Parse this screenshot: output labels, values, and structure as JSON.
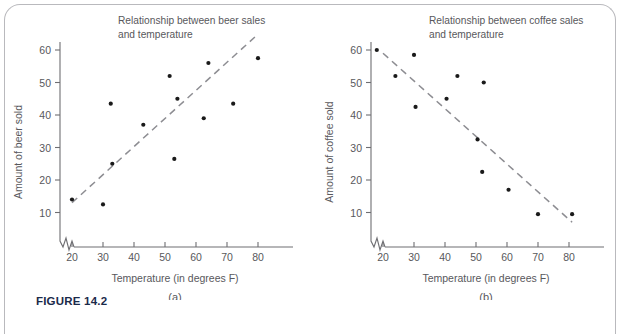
{
  "figure": {
    "caption": "FIGURE 14.2",
    "frame_color": "#b9b9bd",
    "text_color": "#58585c",
    "caption_color": "#1b2a4a",
    "point_color": "#1a1a1a",
    "trend_color": "#8d8d92"
  },
  "chart_data": [
    {
      "type": "scatter",
      "panel": "a",
      "panel_label": "(a)",
      "title": "Relationship between beer sales and temperature",
      "title_line1": "Relationship between beer sales",
      "title_line2": "and temperature",
      "xlabel": "Temperature (in degrees F)",
      "ylabel": "Amount of beer sold",
      "xlim": [
        15,
        90
      ],
      "ylim": [
        0,
        65
      ],
      "xticks": [
        20,
        30,
        40,
        50,
        60,
        70,
        80
      ],
      "yticks": [
        10,
        20,
        30,
        40,
        50,
        60
      ],
      "grid": false,
      "axis_break": true,
      "legend": "none",
      "relationship": "positive",
      "x": [
        20,
        30,
        32.5,
        33,
        43,
        51.5,
        53,
        54,
        62.5,
        64,
        72,
        80
      ],
      "y": [
        14,
        12.5,
        43.5,
        25,
        37,
        52,
        26.5,
        45,
        39,
        56,
        43.5,
        57.5
      ],
      "points": [
        {
          "x": 20,
          "y": 14
        },
        {
          "x": 30,
          "y": 12.5
        },
        {
          "x": 32.5,
          "y": 43.5
        },
        {
          "x": 33,
          "y": 25
        },
        {
          "x": 43,
          "y": 37
        },
        {
          "x": 51.5,
          "y": 52
        },
        {
          "x": 53,
          "y": 26.5
        },
        {
          "x": 54,
          "y": 45
        },
        {
          "x": 62.5,
          "y": 39
        },
        {
          "x": 64,
          "y": 56
        },
        {
          "x": 72,
          "y": 43.5
        },
        {
          "x": 80,
          "y": 57.5
        }
      ],
      "trendline": {
        "x1": 20,
        "y1": 13,
        "x2": 79,
        "y2": 64,
        "style": "dashed"
      }
    },
    {
      "type": "scatter",
      "panel": "b",
      "panel_label": "(b)",
      "title": "Relationship between coffee sales and temperature",
      "title_line1": "Relationship between coffee sales",
      "title_line2": "and temperature",
      "xlabel": "Temperature (in degrees F)",
      "ylabel": "Amount of coffee sold",
      "xlim": [
        15,
        90
      ],
      "ylim": [
        0,
        65
      ],
      "xticks": [
        20,
        30,
        40,
        50,
        60,
        70,
        80
      ],
      "yticks": [
        10,
        20,
        30,
        40,
        50,
        60
      ],
      "grid": false,
      "axis_break": true,
      "legend": "none",
      "relationship": "negative",
      "x": [
        18,
        24,
        30,
        30.5,
        40.5,
        44,
        50.5,
        52,
        52.5,
        60.5,
        70,
        81
      ],
      "y": [
        60,
        52,
        58.5,
        42.5,
        45,
        52,
        32.5,
        22.5,
        50,
        17,
        9.5,
        9.5
      ],
      "points": [
        {
          "x": 18,
          "y": 60
        },
        {
          "x": 24,
          "y": 52
        },
        {
          "x": 30,
          "y": 58.5
        },
        {
          "x": 30.5,
          "y": 42.5
        },
        {
          "x": 40.5,
          "y": 45
        },
        {
          "x": 44,
          "y": 52
        },
        {
          "x": 50.5,
          "y": 32.5
        },
        {
          "x": 52,
          "y": 22.5
        },
        {
          "x": 52.5,
          "y": 50
        },
        {
          "x": 60.5,
          "y": 17
        },
        {
          "x": 70,
          "y": 9.5
        },
        {
          "x": 81,
          "y": 9.5
        }
      ],
      "trendline": {
        "x1": 20,
        "y1": 59,
        "x2": 81,
        "y2": 7,
        "style": "dashed"
      }
    }
  ]
}
